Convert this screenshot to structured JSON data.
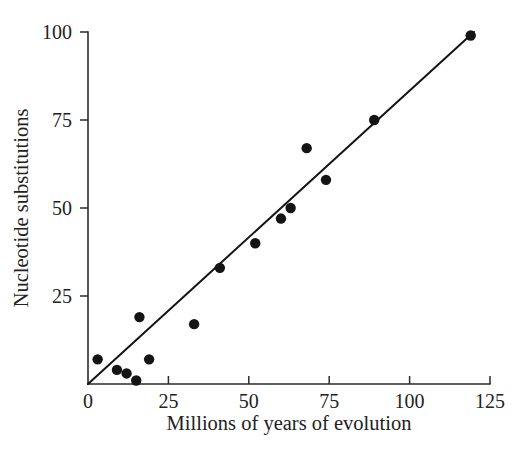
{
  "chart_data": {
    "type": "scatter",
    "title": "",
    "xlabel": "Millions of years of evolution",
    "ylabel": "Nucleotide substitutions",
    "xlim": [
      0,
      125
    ],
    "ylim": [
      0,
      100
    ],
    "xticks": [
      0,
      25,
      50,
      75,
      100,
      125
    ],
    "yticks": [
      0,
      25,
      50,
      75,
      100
    ],
    "xtick_labels": [
      "0",
      "25",
      "50",
      "75",
      "100",
      "125"
    ],
    "ytick_labels": [
      "",
      "25",
      "50",
      "75",
      "100"
    ],
    "grid": false,
    "legend": null,
    "marker_color": "#141414",
    "line_color": "#141414",
    "x": [
      3,
      9,
      12,
      15,
      16,
      19,
      33,
      41,
      52,
      60,
      63,
      68,
      74,
      89,
      119
    ],
    "y": [
      7,
      4,
      3,
      1,
      19,
      7,
      17,
      33,
      40,
      47,
      50,
      67,
      58,
      75,
      99
    ],
    "points": [
      {
        "x": 3,
        "y": 7
      },
      {
        "x": 9,
        "y": 4
      },
      {
        "x": 12,
        "y": 3
      },
      {
        "x": 15,
        "y": 1
      },
      {
        "x": 16,
        "y": 19
      },
      {
        "x": 19,
        "y": 7
      },
      {
        "x": 33,
        "y": 17
      },
      {
        "x": 41,
        "y": 33
      },
      {
        "x": 52,
        "y": 40
      },
      {
        "x": 60,
        "y": 47
      },
      {
        "x": 63,
        "y": 50
      },
      {
        "x": 68,
        "y": 67
      },
      {
        "x": 74,
        "y": 58
      },
      {
        "x": 89,
        "y": 75
      },
      {
        "x": 119,
        "y": 99
      }
    ],
    "trendline": {
      "x0": 0,
      "y0": 0,
      "x1": 120,
      "y1": 100
    }
  }
}
